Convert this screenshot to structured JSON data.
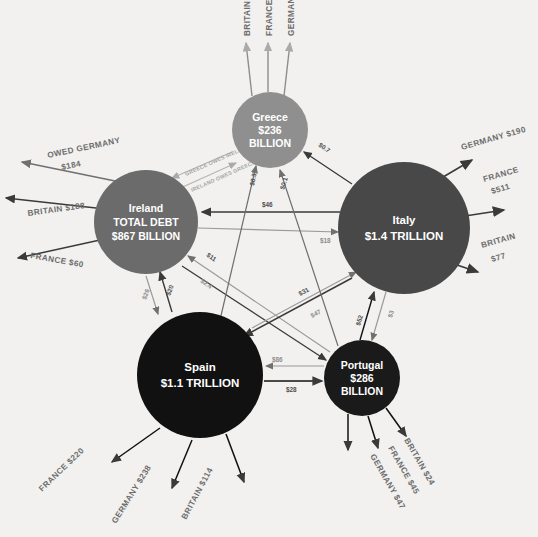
{
  "figure": {
    "background_color": "#f2f1ef",
    "type": "network-diagram"
  },
  "nodes": [
    {
      "id": "greece",
      "name": "Greece",
      "amount": "$236",
      "unit": "BILLION",
      "line1": "Greece",
      "line2": "$236",
      "line3": "BILLION",
      "cx": 270,
      "cy": 130,
      "r": 38,
      "color": "#8f8f8f",
      "text_color": "#ffffff",
      "font_size": 10.5
    },
    {
      "id": "ireland",
      "name": "Ireland",
      "amount": "$867 BILLION",
      "line1": "Ireland",
      "line2": "TOTAL DEBT",
      "line3": "$867 BILLION",
      "cx": 146,
      "cy": 222,
      "r": 52,
      "color": "#6b6b6b",
      "text_color": "#ffffff",
      "font_size": 10.5
    },
    {
      "id": "italy",
      "name": "Italy",
      "amount": "$1.4 TRILLION",
      "line1": "Italy",
      "line2": "$1.4 TRILLION",
      "line3": "",
      "cx": 404,
      "cy": 228,
      "r": 66,
      "color": "#484848",
      "text_color": "#ffffff",
      "font_size": 11.5
    },
    {
      "id": "spain",
      "name": "Spain",
      "amount": "$1.1 TRILLION",
      "line1": "Spain",
      "line2": "$1.1 TRILLION",
      "line3": "",
      "cx": 200,
      "cy": 375,
      "r": 63,
      "color": "#111111",
      "text_color": "#ffffff",
      "font_size": 11.5
    },
    {
      "id": "portugal",
      "name": "Portugal",
      "amount": "$286",
      "unit": "BILLION",
      "line1": "Portugal",
      "line2": "$286",
      "line3": "BILLION",
      "cx": 362,
      "cy": 378,
      "r": 38,
      "color": "#1a1a1a",
      "text_color": "#ffffff",
      "font_size": 10.5
    }
  ],
  "external_creditors": {
    "greece": [
      {
        "label": "BRITAIN $15",
        "creditor": "BRITAIN",
        "amount": "$15"
      },
      {
        "label": "FRANCE $75",
        "creditor": "FRANCE",
        "amount": "$75"
      },
      {
        "label": "GERMANY $45",
        "creditor": "GERMANY",
        "amount": "$45"
      }
    ],
    "ireland": [
      {
        "label": "OWED GERMANY",
        "label2": "$184",
        "creditor": "GERMANY",
        "amount": "$184"
      },
      {
        "label": "BRITAIN $188",
        "creditor": "BRITAIN",
        "amount": "$188"
      },
      {
        "label": "FRANCE $60",
        "creditor": "FRANCE",
        "amount": "$60"
      }
    ],
    "italy": [
      {
        "label": "GERMANY $190",
        "creditor": "GERMANY",
        "amount": "$190"
      },
      {
        "label": "FRANCE",
        "label2": "$511",
        "creditor": "FRANCE",
        "amount": "$511"
      },
      {
        "label": "BRITAIN",
        "label2": "$77",
        "creditor": "BRITAIN",
        "amount": "$77"
      }
    ],
    "spain": [
      {
        "label": "FRANCE $220",
        "creditor": "FRANCE",
        "amount": "$220"
      },
      {
        "label": "GERMANY $238",
        "creditor": "GERMANY",
        "amount": "$238"
      },
      {
        "label": "BRITAIN $114",
        "creditor": "BRITAIN",
        "amount": "$114"
      }
    ],
    "portugal": [
      {
        "label": "BRITAIN $24",
        "creditor": "BRITAIN",
        "amount": "$24"
      },
      {
        "label": "FRANCE $45",
        "creditor": "FRANCE",
        "amount": "$45"
      },
      {
        "label": "GERMANY $47",
        "creditor": "GERMANY",
        "amount": "$47"
      }
    ]
  },
  "pair_labels": [
    {
      "text": "GREECE OWES IRELAND $8.5"
    },
    {
      "text": "IRELAND OWES GREECE $0.6"
    }
  ],
  "internal_flows": [
    {
      "from": "italy",
      "to": "ireland",
      "amount": "$46"
    },
    {
      "from": "ireland",
      "to": "italy",
      "amount": "$18"
    },
    {
      "from": "ireland",
      "to": "spain",
      "amount": "$20"
    },
    {
      "from": "spain",
      "to": "ireland",
      "amount": "$26"
    },
    {
      "from": "ireland",
      "to": "portugal",
      "amount": "$11"
    },
    {
      "from": "portugal",
      "to": "ireland",
      "amount": "$2.4"
    },
    {
      "from": "spain",
      "to": "portugal",
      "amount": "$86"
    },
    {
      "from": "portugal",
      "to": "spain",
      "amount": "$28"
    },
    {
      "from": "italy",
      "to": "spain",
      "amount": "$31"
    },
    {
      "from": "spain",
      "to": "italy",
      "amount": "$47"
    },
    {
      "from": "italy",
      "to": "portugal",
      "amount": "$3"
    },
    {
      "from": "portugal",
      "to": "italy",
      "amount": "$52"
    },
    {
      "from": "greece",
      "to": "italy",
      "amount": "$0.7"
    },
    {
      "from": "italy",
      "to": "greece",
      "amount": "$2.4"
    },
    {
      "from": "greece",
      "to": "spain",
      "amount": "$0.3"
    },
    {
      "from": "spain",
      "to": "greece",
      "amount": "$1.3"
    },
    {
      "from": "greece",
      "to": "portugal",
      "amount": "$0.1"
    },
    {
      "from": "portugal",
      "to": "greece",
      "amount": "$9.7"
    }
  ]
}
